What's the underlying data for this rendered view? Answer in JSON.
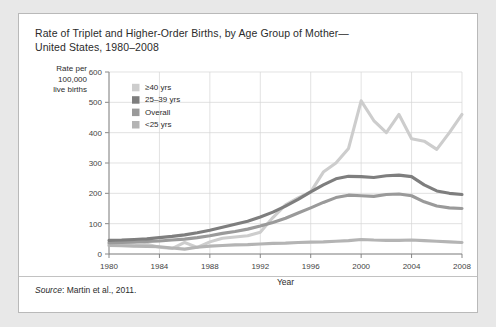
{
  "card": {
    "title_line1": "Rate of  Triplet and Higher-Order Births, by Age Group of Mother—",
    "title_line2": "United States, 1980–2008",
    "source_prefix": "Source",
    "source_text": ": Martin et al., 2011."
  },
  "ylabel_lines": [
    "Rate per",
    "100,000",
    "live births"
  ],
  "colors": {
    "ge40": "#cdcdcd",
    "a2539": "#7e7e7e",
    "overall": "#9a9a9a",
    "lt25": "#b4b4b4",
    "grid": "#d5d5d5",
    "axis": "#7a7a7a",
    "text": "#2b2b2b",
    "card_bg": "#ffffff",
    "page_bg": "#e8e8e8",
    "card_border": "#b9b9b9"
  },
  "chart_data": {
    "type": "line",
    "xlabel": "Year",
    "ylabel": "Rate per 100,000 live births",
    "xlim": [
      1980,
      2008
    ],
    "ylim": [
      0,
      600
    ],
    "yticks": [
      0,
      100,
      200,
      300,
      400,
      500,
      600
    ],
    "xticks": [
      1980,
      1984,
      1988,
      1992,
      1996,
      2000,
      2004,
      2008
    ],
    "grid": true,
    "legend_position": "upper-left-inside",
    "x": [
      1980,
      1981,
      1982,
      1983,
      1984,
      1985,
      1986,
      1987,
      1988,
      1989,
      1990,
      1991,
      1992,
      1993,
      1994,
      1995,
      1996,
      1997,
      1998,
      1999,
      2000,
      2001,
      2002,
      2003,
      2004,
      2005,
      2006,
      2007,
      2008
    ],
    "series": [
      {
        "name": "≥40 yrs",
        "color": "#cdcdcd",
        "values": [
          33,
          30,
          27,
          32,
          22,
          18,
          38,
          22,
          40,
          52,
          56,
          60,
          72,
          120,
          162,
          185,
          205,
          270,
          300,
          348,
          505,
          440,
          400,
          460,
          380,
          372,
          345,
          400,
          460
        ]
      },
      {
        "name": "25–39 yrs",
        "color": "#7e7e7e",
        "values": [
          45,
          46,
          48,
          50,
          54,
          58,
          63,
          70,
          78,
          88,
          98,
          108,
          122,
          138,
          158,
          180,
          205,
          228,
          248,
          256,
          255,
          252,
          258,
          260,
          255,
          228,
          208,
          200,
          196
        ]
      },
      {
        "name": "Overall",
        "color": "#9a9a9a",
        "values": [
          37,
          38,
          39,
          41,
          43,
          46,
          49,
          54,
          60,
          68,
          74,
          82,
          92,
          104,
          118,
          135,
          152,
          170,
          186,
          194,
          192,
          190,
          196,
          198,
          192,
          172,
          158,
          152,
          150
        ]
      },
      {
        "name": "<25 yrs",
        "color": "#b4b4b4",
        "values": [
          28,
          27,
          26,
          25,
          24,
          20,
          16,
          22,
          26,
          28,
          30,
          31,
          33,
          35,
          36,
          38,
          39,
          40,
          42,
          44,
          48,
          46,
          45,
          45,
          46,
          44,
          42,
          40,
          38
        ]
      }
    ]
  }
}
